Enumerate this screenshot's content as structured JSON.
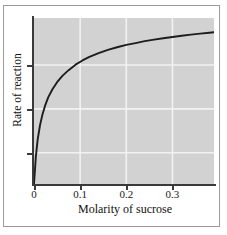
{
  "figure": {
    "background_color": "#ffffff",
    "frame_color": "#9a9a9a",
    "panel_color": "#d2d2d2",
    "gridline_color": "#f2f2f2",
    "axis_color": "#3a3a3a",
    "curve_color": "#1d1d1d"
  },
  "chart_data": {
    "type": "line",
    "title": "",
    "xlabel": "Molarity of sucrose",
    "ylabel": "Rate of reaction",
    "xlim": [
      0,
      0.39
    ],
    "ylim": [
      0,
      1.06
    ],
    "grid": true,
    "legend": "none",
    "xticks": [
      0,
      0.1,
      0.2,
      0.3
    ],
    "xticklabels": [
      "0",
      "0.1",
      "0.2",
      "0.3"
    ],
    "yticks": [
      0.2,
      0.48,
      0.76
    ],
    "yticklabels": [
      "",
      "",
      ""
    ],
    "series": [
      {
        "name": "Rate of reaction vs substrate concentration",
        "shape": "saturation (hyperbolic, Michaelis-Menten)",
        "x": [
          0,
          0.004,
          0.008,
          0.013,
          0.018,
          0.024,
          0.031,
          0.04,
          0.05,
          0.062,
          0.075,
          0.09,
          0.105,
          0.12,
          0.14,
          0.16,
          0.18,
          0.2,
          0.22,
          0.24,
          0.26,
          0.28,
          0.3,
          0.32,
          0.34,
          0.36,
          0.38,
          0.39
        ],
        "y": [
          0,
          0.175,
          0.285,
          0.375,
          0.44,
          0.5,
          0.555,
          0.605,
          0.65,
          0.692,
          0.727,
          0.762,
          0.789,
          0.812,
          0.836,
          0.856,
          0.873,
          0.888,
          0.9,
          0.912,
          0.922,
          0.931,
          0.939,
          0.947,
          0.954,
          0.96,
          0.966,
          0.969
        ]
      }
    ]
  },
  "axis_titles": {
    "x": "Molarity of sucrose",
    "y": "Rate of reaction"
  }
}
